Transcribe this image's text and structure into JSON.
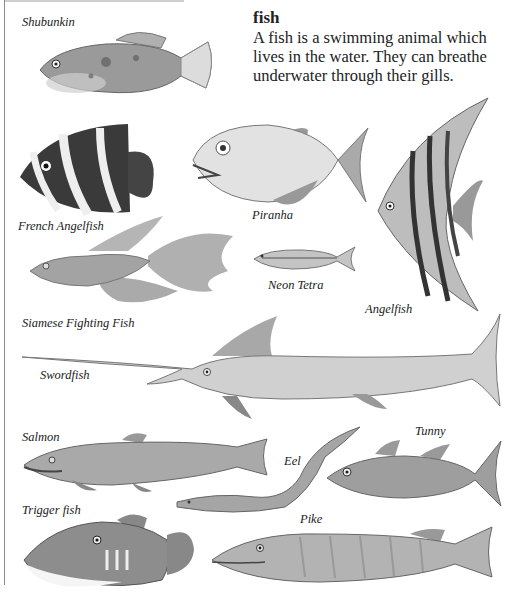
{
  "entry": {
    "headword": "fish",
    "definition": "A fish is a swimming animal which lives in the water. They can breathe underwater through their gills."
  },
  "illustrations": [
    {
      "name": "shubunkin",
      "label": "Shubunkin"
    },
    {
      "name": "french-angelfish",
      "label": "French Angelfish"
    },
    {
      "name": "piranha",
      "label": "Piranha"
    },
    {
      "name": "angelfish",
      "label": "Angelfish"
    },
    {
      "name": "siamese-fighting-fish",
      "label": "Siamese Fighting Fish"
    },
    {
      "name": "neon-tetra",
      "label": "Neon Tetra"
    },
    {
      "name": "swordfish",
      "label": "Swordfish"
    },
    {
      "name": "salmon",
      "label": "Salmon"
    },
    {
      "name": "eel",
      "label": "Eel"
    },
    {
      "name": "tunny",
      "label": "Tunny"
    },
    {
      "name": "trigger-fish",
      "label": "Trigger fish"
    },
    {
      "name": "pike",
      "label": "Pike"
    }
  ],
  "colors": {
    "ink": "#1a1a1a",
    "fish_light": "#d9d9d9",
    "fish_mid": "#a8a8a8",
    "fish_dark": "#4a4a4a"
  }
}
